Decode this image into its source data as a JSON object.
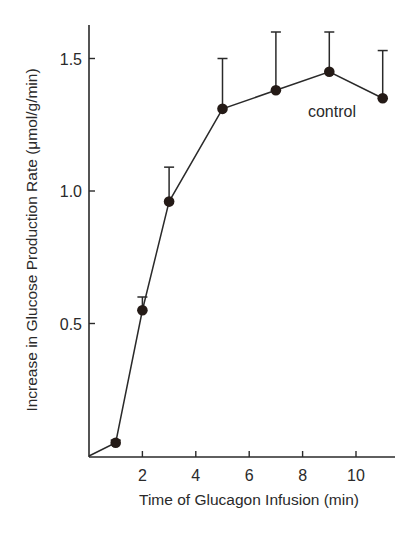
{
  "chart_data": {
    "type": "line",
    "title": "",
    "xlabel": "Time of Glucagon Infusion (min)",
    "ylabel": "Increase in Glucose Production Rate (μmol/g/min)",
    "xlim": [
      0,
      11.5
    ],
    "ylim": [
      0,
      1.65
    ],
    "x_ticks": [
      2,
      4,
      6,
      8,
      10
    ],
    "x_tick_labels": [
      "2",
      "4",
      "6",
      "8",
      "10"
    ],
    "y_ticks": [
      0.5,
      1.0,
      1.5
    ],
    "y_tick_labels": [
      "0.5",
      "1.0",
      "1.5"
    ],
    "grid": false,
    "legend": null,
    "series": [
      {
        "name": "control",
        "x": [
          0,
          1,
          2,
          3,
          5,
          7,
          9,
          11
        ],
        "values": [
          0,
          0.05,
          0.55,
          0.96,
          1.31,
          1.38,
          1.45,
          1.35
        ],
        "error_upper": [
          null,
          0.06,
          0.6,
          1.09,
          1.5,
          1.6,
          1.6,
          1.53
        ],
        "markers": [
          false,
          true,
          true,
          true,
          true,
          true,
          true,
          true
        ],
        "color": "#2a2a2a"
      }
    ],
    "annotations": [
      {
        "text": "control",
        "x": 8.2,
        "y": 1.3
      }
    ]
  }
}
